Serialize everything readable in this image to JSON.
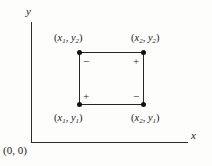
{
  "figure": {
    "type": "geometry-diagram",
    "background_color": "#fdfdfc",
    "stroke_color": "#262626"
  },
  "axes": {
    "y_label": "y",
    "x_label": "x",
    "origin_label": "(0, 0)"
  },
  "corners": {
    "top_left": {
      "open": "(",
      "x_var": "x",
      "x_sub": "1",
      "comma": ", ",
      "y_var": "y",
      "y_sub": "2",
      "close": ")",
      "sign": "−"
    },
    "top_right": {
      "open": "(",
      "x_var": "x",
      "x_sub": "2",
      "comma": ", ",
      "y_var": "y",
      "y_sub": "2",
      "close": ")",
      "sign": "+"
    },
    "bottom_left": {
      "open": "(",
      "x_var": "x",
      "x_sub": "1",
      "comma": ", ",
      "y_var": "y",
      "y_sub": "1",
      "close": ")",
      "sign": "+"
    },
    "bottom_right": {
      "open": "(",
      "x_var": "x",
      "x_sub": "2",
      "comma": ", ",
      "y_var": "y",
      "y_sub": "1",
      "close": ")",
      "sign": "−"
    }
  }
}
